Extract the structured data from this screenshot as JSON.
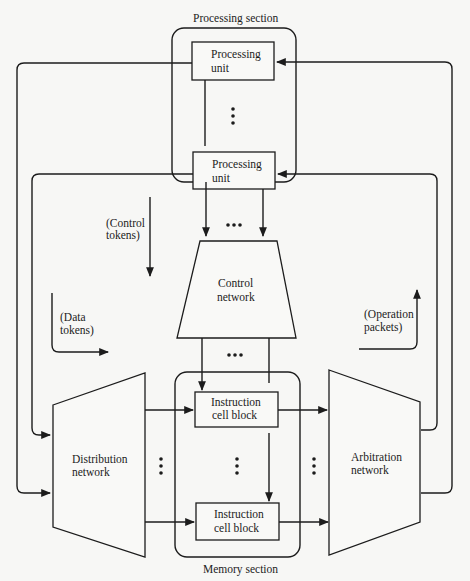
{
  "diagram": {
    "type": "dataflow-architecture",
    "sections": {
      "processing": {
        "label": "Processing section"
      },
      "memory": {
        "label": "Memory section"
      }
    },
    "nodes": {
      "processing_unit_top": {
        "line1": "Processing",
        "line2": "unit"
      },
      "processing_unit_bottom": {
        "line1": "Processing",
        "line2": "unit"
      },
      "control_network": {
        "line1": "Control",
        "line2": "network"
      },
      "distribution_network": {
        "line1": "Distribution",
        "line2": "network"
      },
      "instruction_cell_block_top": {
        "line1": "Instruction",
        "line2": "cell block"
      },
      "instruction_cell_block_bottom": {
        "line1": "Instruction",
        "line2": "cell block"
      },
      "arbitration_network": {
        "line1": "Arbitration",
        "line2": "network"
      }
    },
    "annotations": {
      "control_tokens": {
        "line1": "(Control",
        "line2": "tokens)"
      },
      "data_tokens": {
        "line1": "(Data",
        "line2": "tokens)"
      },
      "operation_packets": {
        "line1": "(Operation",
        "line2": "packets)"
      }
    },
    "ellipsis": "•••",
    "edges": [
      {
        "from": "processing_unit_top",
        "to": "distribution_network",
        "label": "data tokens"
      },
      {
        "from": "processing_unit_bottom",
        "to": "distribution_network",
        "label": "data tokens"
      },
      {
        "from": "processing_section",
        "to": "control_network",
        "label": "control tokens"
      },
      {
        "from": "control_network",
        "to": "memory_section",
        "label": "control tokens"
      },
      {
        "from": "distribution_network",
        "to": "instruction_cell_block_top"
      },
      {
        "from": "distribution_network",
        "to": "instruction_cell_block_bottom"
      },
      {
        "from": "instruction_cell_block_top",
        "to": "arbitration_network"
      },
      {
        "from": "instruction_cell_block_bottom",
        "to": "arbitration_network"
      },
      {
        "from": "arbitration_network",
        "to": "processing_unit_top",
        "label": "operation packets"
      },
      {
        "from": "arbitration_network",
        "to": "processing_unit_bottom",
        "label": "operation packets"
      }
    ]
  }
}
